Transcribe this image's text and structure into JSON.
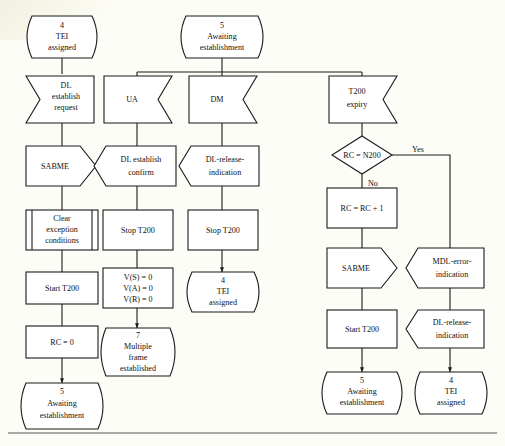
{
  "diagram": {
    "line_color": "#1a1a1a",
    "fill_color": "#ffffff",
    "background_color": "#fdfdf7",
    "branch_labels": {
      "yes": "Yes",
      "no": "No"
    },
    "nodes": [
      {
        "id": "s4_top",
        "kind": "state",
        "lines": [
          "4",
          "TEI",
          "assigned"
        ]
      },
      {
        "id": "s5_top",
        "kind": "state",
        "lines": [
          "5",
          "Awaiting",
          "establishment"
        ]
      },
      {
        "id": "in_dl_req",
        "kind": "input-left",
        "lines": [
          "DL",
          "establish",
          "request"
        ]
      },
      {
        "id": "in_ua",
        "kind": "input",
        "lines": [
          "UA"
        ]
      },
      {
        "id": "in_dm",
        "kind": "input",
        "lines": [
          "DM"
        ]
      },
      {
        "id": "in_t200",
        "kind": "input",
        "lines": [
          "T200",
          "expiry"
        ]
      },
      {
        "id": "out_sabme_1",
        "kind": "output",
        "lines": [
          "SABME"
        ]
      },
      {
        "id": "out_dl_conf",
        "kind": "signal-in",
        "lines": [
          "DL establish",
          "confirm"
        ]
      },
      {
        "id": "out_dl_rel_1",
        "kind": "signal-in",
        "lines": [
          "DL-release-",
          "indication"
        ]
      },
      {
        "id": "dec_rc_n200",
        "kind": "decision",
        "lines": [
          "RC = N200"
        ]
      },
      {
        "id": "proc_clear",
        "kind": "procedure",
        "lines": [
          "Clear",
          "exception",
          "conditions"
        ]
      },
      {
        "id": "task_stop_1",
        "kind": "task",
        "lines": [
          "Stop T200"
        ]
      },
      {
        "id": "task_stop_2",
        "kind": "task",
        "lines": [
          "Stop T200"
        ]
      },
      {
        "id": "task_rc_inc",
        "kind": "task",
        "lines": [
          "RC = RC + 1"
        ]
      },
      {
        "id": "task_start_1",
        "kind": "task",
        "lines": [
          "Start T200"
        ]
      },
      {
        "id": "task_vars",
        "kind": "task",
        "lines": [
          "V(S) = 0",
          "V(A) = 0",
          "V(R) = 0"
        ]
      },
      {
        "id": "s4_mid",
        "kind": "state",
        "lines": [
          "4",
          "TEI",
          "assigned"
        ]
      },
      {
        "id": "out_sabme_2",
        "kind": "output",
        "lines": [
          "SABME"
        ]
      },
      {
        "id": "out_mdl_err",
        "kind": "signal-in",
        "lines": [
          "MDL-error-",
          "indication"
        ]
      },
      {
        "id": "task_rc0",
        "kind": "task",
        "lines": [
          "RC = 0"
        ]
      },
      {
        "id": "s7",
        "kind": "state",
        "lines": [
          "7",
          "Multiple",
          "frame",
          "established"
        ]
      },
      {
        "id": "task_start_2",
        "kind": "task",
        "lines": [
          "Start T200"
        ]
      },
      {
        "id": "out_dl_rel_2",
        "kind": "signal-in",
        "lines": [
          "DL-release-",
          "indication"
        ]
      },
      {
        "id": "s5_bottom_l",
        "kind": "state",
        "lines": [
          "5",
          "Awaiting",
          "establishment"
        ]
      },
      {
        "id": "s5_bottom_r",
        "kind": "state",
        "lines": [
          "5",
          "Awaiting",
          "establishment"
        ]
      },
      {
        "id": "s4_bottom",
        "kind": "state",
        "lines": [
          "4",
          "TEI",
          "assigned"
        ]
      }
    ]
  }
}
